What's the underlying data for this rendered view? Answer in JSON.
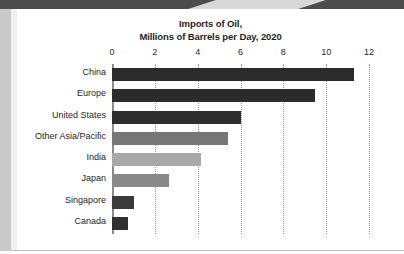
{
  "page": {
    "background_color": "#ffffff",
    "top_band_color": "#4c4c4c",
    "gutter_color": "#c9c9c9"
  },
  "chart_data": {
    "type": "bar",
    "orientation": "horizontal",
    "title_line1": "Imports of Oil,",
    "title_line2": "Millions of Barrels per Day, 2020",
    "title": "Imports of Oil, Millions of Barrels per Day, 2020",
    "xlabel": "",
    "ylabel": "",
    "xlim": [
      0,
      12
    ],
    "xticks": [
      0,
      2,
      4,
      6,
      8,
      10,
      12
    ],
    "xtick_labels": [
      "0",
      "2",
      "4",
      "6",
      "8",
      "10",
      "12"
    ],
    "grid": "vertical-dotted",
    "legend": "none",
    "categories": [
      "China",
      "Europe",
      "United States",
      "Other Asia/Pacific",
      "India",
      "Japan",
      "Singapore",
      "Canada"
    ],
    "values": [
      11.3,
      9.5,
      6.0,
      5.4,
      4.15,
      2.65,
      1.05,
      0.75
    ],
    "bar_colors": [
      "#2b2b2b",
      "#2b2b2b",
      "#2e2e2e",
      "#767676",
      "#a8a8a8",
      "#8a8a8a",
      "#3a3a3a",
      "#303030"
    ],
    "bars": [
      {
        "label": "China",
        "value": 11.3,
        "color": "#2b2b2b"
      },
      {
        "label": "Europe",
        "value": 9.5,
        "color": "#2b2b2b"
      },
      {
        "label": "United States",
        "value": 6.0,
        "color": "#2e2e2e"
      },
      {
        "label": "Other Asia/Pacific",
        "value": 5.4,
        "color": "#767676"
      },
      {
        "label": "India",
        "value": 4.15,
        "color": "#a8a8a8"
      },
      {
        "label": "Japan",
        "value": 2.65,
        "color": "#8a8a8a"
      },
      {
        "label": "Singapore",
        "value": 1.05,
        "color": "#3a3a3a"
      },
      {
        "label": "Canada",
        "value": 0.75,
        "color": "#303030"
      }
    ]
  }
}
